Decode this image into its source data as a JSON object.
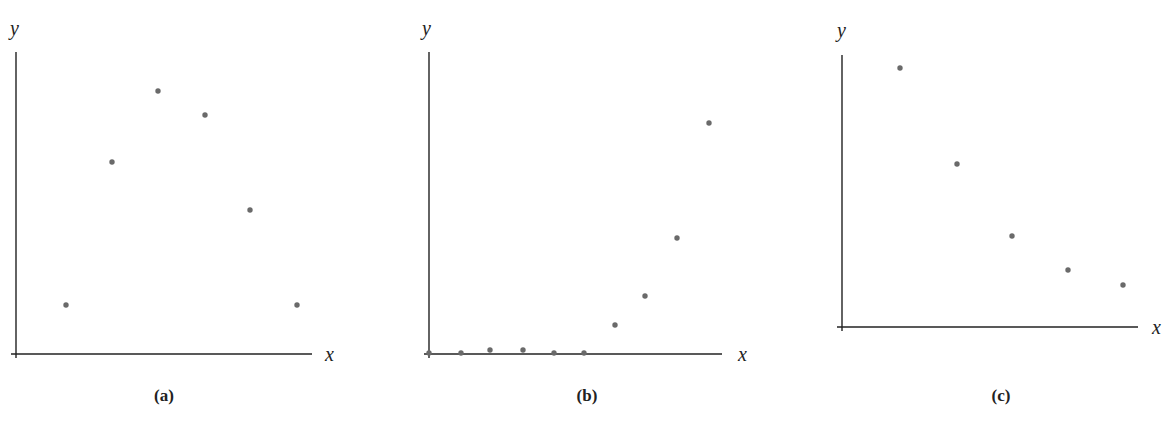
{
  "chart_data": [
    {
      "type": "scatter",
      "panel": "(a)",
      "xlabel": "x",
      "ylabel": "y",
      "grid": false,
      "ticks": false,
      "x": [
        1,
        2,
        3,
        4,
        5,
        6
      ],
      "y": [
        1.0,
        4.0,
        5.5,
        5.0,
        3.0,
        1.0
      ],
      "frame": {
        "origin": [
          16,
          354
        ],
        "x_end": 312,
        "y_top": 52
      },
      "px_points": [
        [
          66,
          305
        ],
        [
          112,
          162
        ],
        [
          158,
          91
        ],
        [
          205,
          115
        ],
        [
          250,
          210
        ],
        [
          297,
          305
        ]
      ],
      "label_pos": {
        "y": [
          16,
          32
        ],
        "x": [
          330,
          358
        ],
        "caption": [
          164,
          400
        ]
      }
    },
    {
      "type": "scatter",
      "panel": "(b)",
      "xlabel": "x",
      "ylabel": "y",
      "grid": false,
      "ticks": false,
      "x": [
        0,
        1,
        2,
        3,
        4,
        5,
        6,
        7,
        8,
        9
      ],
      "y": [
        0,
        0,
        0.1,
        0.1,
        0,
        0,
        0.8,
        1.6,
        3.3,
        6.4
      ],
      "frame": {
        "origin": [
          429,
          354
        ],
        "x_end": 722,
        "y_top": 52
      },
      "px_points": [
        [
          429,
          353
        ],
        [
          461,
          353
        ],
        [
          490,
          350
        ],
        [
          523,
          350
        ],
        [
          554,
          353
        ],
        [
          584,
          353
        ],
        [
          615,
          325
        ],
        [
          645,
          296
        ],
        [
          677,
          238
        ],
        [
          709,
          123
        ]
      ],
      "label_pos": {
        "y": [
          428,
          32
        ],
        "x": [
          745,
          358
        ],
        "caption": [
          586,
          400
        ]
      }
    },
    {
      "type": "scatter",
      "panel": "(c)",
      "xlabel": "x",
      "ylabel": "y",
      "grid": false,
      "ticks": false,
      "x": [
        1,
        2,
        3,
        4,
        5
      ],
      "y": [
        4.5,
        3.0,
        1.6,
        1.0,
        0.8
      ],
      "frame": {
        "origin": [
          842,
          327
        ],
        "x_end": 1138,
        "y_top": 55
      },
      "px_points": [
        [
          900,
          68
        ],
        [
          957,
          164
        ],
        [
          1012,
          236
        ],
        [
          1068,
          270
        ],
        [
          1123,
          285
        ]
      ],
      "label_pos": {
        "y": [
          842,
          34
        ],
        "x": [
          1158,
          332
        ],
        "caption": [
          1000,
          400
        ]
      }
    }
  ],
  "panels": [
    {
      "caption": "(a)",
      "x_axis_label": "x",
      "y_axis_label": "y"
    },
    {
      "caption": "(b)",
      "x_axis_label": "x",
      "y_axis_label": "y"
    },
    {
      "caption": "(c)",
      "x_axis_label": "x",
      "y_axis_label": "y"
    }
  ],
  "colors": {
    "axis": "#222222",
    "dot": "#6a6a6a",
    "background": "#ffffff"
  }
}
